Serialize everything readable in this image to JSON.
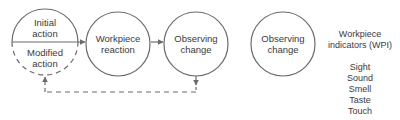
{
  "diagram": {
    "colors": {
      "stroke": "#6b6b6b",
      "text": "#3a3a3a",
      "background": "#ffffff"
    },
    "loop": {
      "action_circle": {
        "top_lines": [
          "Initial",
          "action"
        ],
        "bottom_lines": [
          "Modified",
          "action"
        ]
      },
      "reaction_circle": {
        "lines": [
          "Workpiece",
          "reaction"
        ]
      },
      "observe_circle": {
        "lines": [
          "Observing",
          "change"
        ]
      },
      "feedback": {
        "style": "dashed",
        "from": "Observing change",
        "to": "Modified action"
      }
    },
    "detail": {
      "observe_circle": {
        "lines": [
          "Observing",
          "change"
        ]
      },
      "indicators_title": [
        "Workpiece",
        "indicators (WPI)"
      ],
      "indicators": [
        "Sight",
        "Sound",
        "Smell",
        "Taste",
        "Touch"
      ]
    }
  }
}
